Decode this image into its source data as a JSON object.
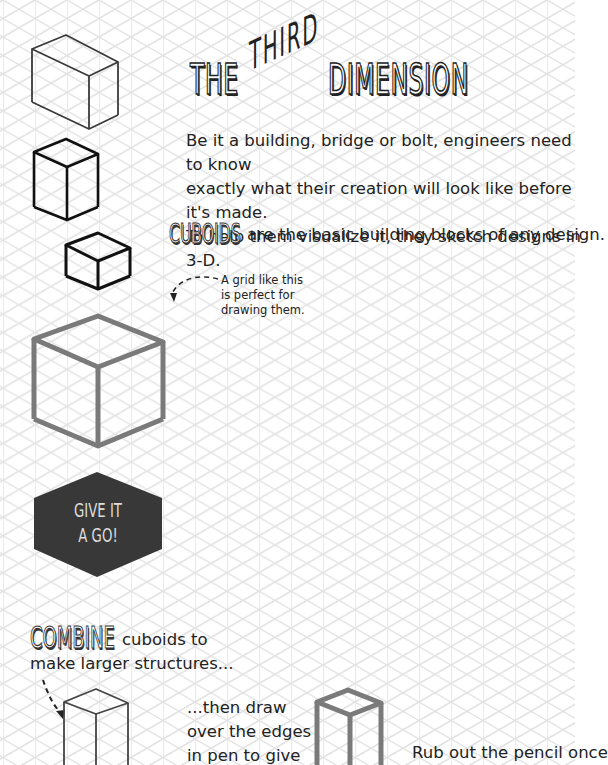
{
  "page": {
    "title_part1": "THE",
    "title_part2": "THIRD",
    "title_part3": "DIMENSION",
    "intro_lines": [
      "Be it a building, bridge or bolt, engineers need to know",
      "exactly what their creation will look like before it's made.",
      "To help them visualize it, they sketch designs in 3-D."
    ],
    "cuboids_heading": "CUBOIDS",
    "cuboids_text": "are the basic building blocks of any design.",
    "grid_note_lines": [
      "A grid like this",
      "is perfect for",
      "drawing them."
    ],
    "give_it_a_go_lines": [
      "GIVE IT",
      "A GO!"
    ],
    "combine_heading": "COMBINE",
    "combine_text": "cuboids to",
    "combine_line2": "make larger structures...",
    "then_lines": [
      "...then draw",
      "over the edges",
      "in pen to give"
    ],
    "rub_text": "Rub out the pencil once"
  },
  "colors": {
    "grid_line": "#e2e2e2",
    "ink": "#222222",
    "grey_cube": "#7a7a7a",
    "hexagon_fill": "#383838",
    "hexagon_text": "#d8d8d8"
  },
  "icons": {
    "sketch_cuboids": [
      "pencil-cuboid-large",
      "pen-cuboid-tall",
      "pen-cuboid-small",
      "grey-cube",
      "pencil-tower",
      "grey-tower"
    ],
    "arrows": [
      "dashed-curved-arrow",
      "dashed-straight-arrow"
    ]
  }
}
